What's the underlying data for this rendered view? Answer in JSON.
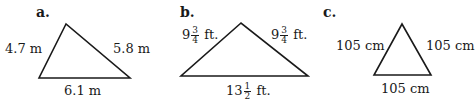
{
  "figures": [
    {
      "id": "a",
      "label": "a.",
      "sides": {
        "left": "4.7 m",
        "right": "5.8 m",
        "bottom": "6.1 m"
      }
    },
    {
      "id": "b",
      "label": "b.",
      "sides": {
        "left": {
          "whole": "9",
          "num": "3",
          "den": "4",
          "unit": "ft."
        },
        "right": {
          "whole": "9",
          "num": "3",
          "den": "4",
          "unit": "ft."
        },
        "bottom": {
          "whole": "13",
          "num": "1",
          "den": "2",
          "unit": "ft."
        }
      }
    },
    {
      "id": "c",
      "label": "c.",
      "sides": {
        "left": "105 cm",
        "right": "105 cm",
        "bottom": "105 cm"
      }
    }
  ],
  "colors": {
    "stroke": "#1a1a1a",
    "background": "#ffffff"
  }
}
